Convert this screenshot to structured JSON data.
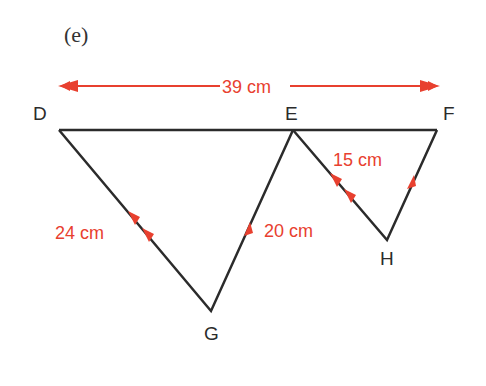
{
  "figure": {
    "part_label": "(e)",
    "colors": {
      "line": "#2b2b2b",
      "annotation": "#e8402f"
    },
    "vertices": {
      "D": {
        "label": "D",
        "x": 59,
        "y": 130
      },
      "E": {
        "label": "E",
        "x": 293,
        "y": 130
      },
      "F": {
        "label": "F",
        "x": 437,
        "y": 130
      },
      "G": {
        "label": "G",
        "x": 211,
        "y": 311
      },
      "H": {
        "label": "H",
        "x": 387,
        "y": 240
      }
    },
    "measurements": {
      "DF": "39 cm",
      "DG": "24 cm",
      "EG": "20 cm",
      "EH": "15 cm"
    },
    "parallel_marks": {
      "DG": 2,
      "EH": 2,
      "EG": 1,
      "FH": 1
    }
  }
}
